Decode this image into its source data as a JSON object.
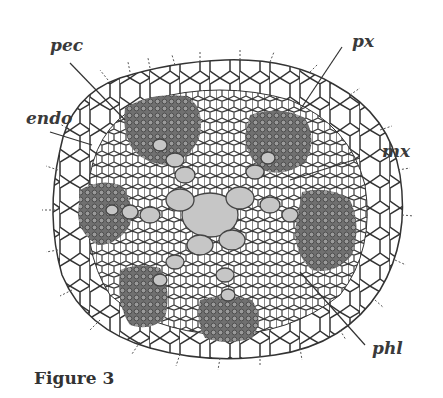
{
  "figure": {
    "caption": "Figure 3",
    "labels": {
      "pec": "pec",
      "endo": "endo",
      "px": "px",
      "mx": "mx",
      "phl": "phl"
    }
  },
  "colors": {
    "cell_wall": "#3a3a3a",
    "phloem_fill": "#6b6b6b",
    "xylem_fill": "#c8c8c8",
    "background": "#ffffff"
  }
}
